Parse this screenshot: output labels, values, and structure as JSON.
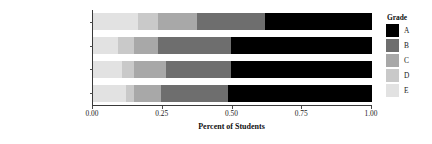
{
  "chart_data": {
    "type": "bar",
    "orientation": "horizontal",
    "stacked": true,
    "title": "",
    "xlabel": "Percent of Students",
    "ylabel": "",
    "xlim": [
      0.0,
      1.0
    ],
    "xticks": [
      "0.00",
      "0.25",
      "0.50",
      "0.75",
      "1.00"
    ],
    "xtick_values": [
      0.0,
      0.25,
      0.5,
      0.75,
      1.0
    ],
    "grid": false,
    "legend_position": "right",
    "legend_title": "Grade",
    "categories": [
      "Freshman (n = 1431)",
      "Sophomore (n = 584)",
      "Junior (n = 209)",
      "Senior (n = 146)"
    ],
    "series": [
      {
        "name": "E",
        "color": "#e2e2e2",
        "values": [
          0.16,
          0.09,
          0.104,
          0.118
        ]
      },
      {
        "name": "D",
        "color": "#c9c9c9",
        "values": [
          0.073,
          0.057,
          0.043,
          0.029
        ]
      },
      {
        "name": "C",
        "color": "#a8a8a8",
        "values": [
          0.14,
          0.086,
          0.115,
          0.097
        ]
      },
      {
        "name": "B",
        "color": "#6e6e6e",
        "values": [
          0.243,
          0.262,
          0.233,
          0.24
        ]
      },
      {
        "name": "A",
        "color": "#000000",
        "values": [
          0.384,
          0.505,
          0.505,
          0.516
        ]
      }
    ]
  },
  "legend": {
    "title": "Grade",
    "items": [
      {
        "label": "A",
        "color": "#000000"
      },
      {
        "label": "B",
        "color": "#6e6e6e"
      },
      {
        "label": "C",
        "color": "#a8a8a8"
      },
      {
        "label": "D",
        "color": "#c9c9c9"
      },
      {
        "label": "E",
        "color": "#e2e2e2"
      }
    ]
  },
  "axes": {
    "x_title": "Percent of Students",
    "x_ticks": [
      "0.00",
      "0.25",
      "0.50",
      "0.75",
      "1.00"
    ],
    "y_ticks": [
      "Freshman (n = 1431)",
      "Sophomore (n = 584)",
      "Junior (n = 209)",
      "Senior (n = 146)"
    ]
  }
}
